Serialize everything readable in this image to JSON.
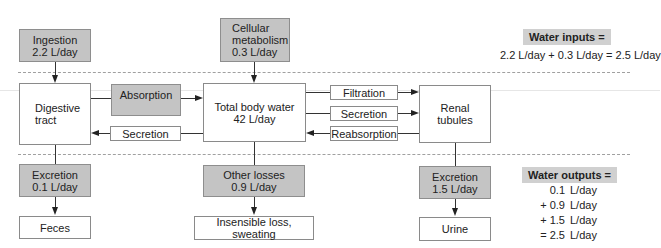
{
  "inputs": {
    "ingestion": {
      "line1": "Ingestion",
      "line2": "2.2 L/day"
    },
    "cellular_metabolism": {
      "line1": "Cellular",
      "line2": "metabolism",
      "line3": "0.3 L/day"
    }
  },
  "compartments": {
    "digestive_tract": {
      "line1": "Digestive",
      "line2": "tract"
    },
    "total_body_water": {
      "line1": "Total body water",
      "line2": "42 L/day"
    },
    "renal_tubules": {
      "line1": "Renal",
      "line2": "tubules"
    }
  },
  "processes": {
    "absorption": "Absorption",
    "secretion_gi": "Secretion",
    "filtration": "Filtration",
    "secretion_renal": "Secretion",
    "reabsorption": "Reabsorption"
  },
  "outputs": {
    "excretion_gi": {
      "line1": "Excretion",
      "line2": "0.1 L/day"
    },
    "other_losses": {
      "line1": "Other losses",
      "line2": "0.9 L/day"
    },
    "excretion_renal": {
      "line1": "Excretion",
      "line2": "1.5 L/day"
    }
  },
  "destinations": {
    "feces": "Feces",
    "insensible": "Insensible loss, sweating",
    "urine": "Urine"
  },
  "summary": {
    "inputs_title": "Water inputs =",
    "inputs_equation": "2.2 L/day + 0.3 L/day = 2.5 L/day",
    "outputs_title": "Water outputs =",
    "outputs_rows": [
      {
        "num": "0.1",
        "unit": "L/day"
      },
      {
        "num": "+ 0.9",
        "unit": "L/day"
      },
      {
        "num": "+ 1.5",
        "unit": "L/day"
      },
      {
        "num": "= 2.5",
        "unit": "L/day"
      }
    ]
  },
  "colors": {
    "gray_box": "#c4c4c4",
    "summary_title_bg": "#d0d0d0",
    "dashed_line": "#a0a0a0"
  }
}
